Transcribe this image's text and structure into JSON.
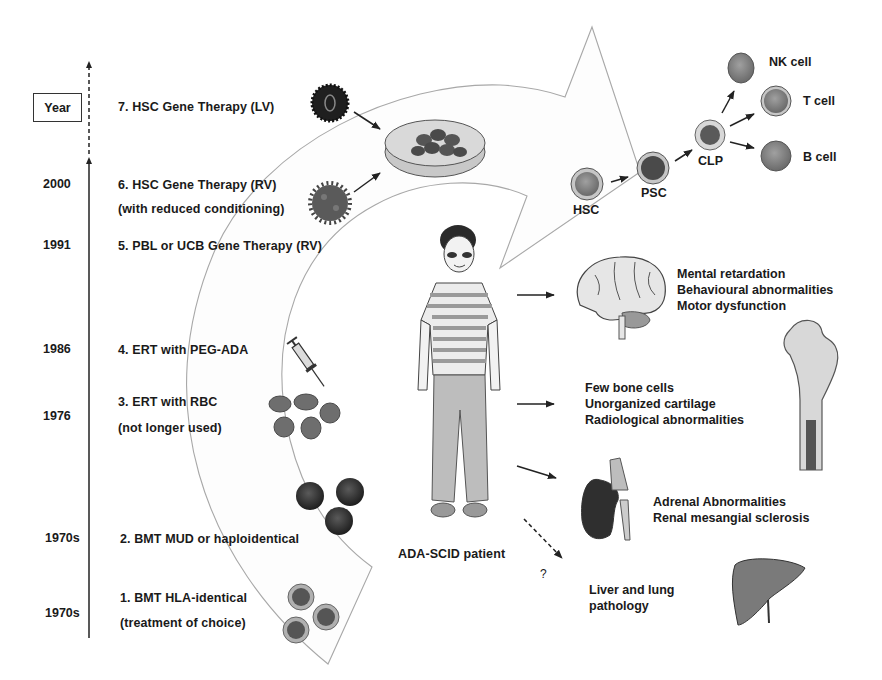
{
  "timeline": {
    "axis_label": "Year",
    "entries": [
      {
        "year": "",
        "label_lines": [
          "7. HSC Gene Therapy (LV)"
        ],
        "icon": "lentivirus-icon"
      },
      {
        "year": "2000",
        "label_lines": [
          "6. HSC Gene Therapy (RV)",
          "(with reduced conditioning)"
        ],
        "icon": "retrovirus-icon"
      },
      {
        "year": "1991",
        "label_lines": [
          "5. PBL or UCB Gene Therapy (RV)"
        ],
        "icon": ""
      },
      {
        "year": "1986",
        "label_lines": [
          "4. ERT with PEG-ADA"
        ],
        "icon": "syringe-icon"
      },
      {
        "year": "1976",
        "label_lines": [
          "3. ERT with RBC",
          "(not longer used)"
        ],
        "icon": "red-blood-cells-icon"
      },
      {
        "year": "1970s",
        "label_lines": [
          "2. BMT MUD or haploidentical"
        ],
        "icon": "bone-marrow-cells-icon"
      },
      {
        "year": "1970s",
        "label_lines": [
          "1. BMT HLA-identical",
          "(treatment of choice)"
        ],
        "icon": "hla-cells-icon"
      }
    ]
  },
  "patient": {
    "label": "ADA-SCID patient"
  },
  "hematopoiesis": {
    "cells": [
      {
        "id": "hsc",
        "label": "HSC"
      },
      {
        "id": "psc",
        "label": "PSC"
      },
      {
        "id": "clp",
        "label": "CLP"
      },
      {
        "id": "nk",
        "label": "NK cell"
      },
      {
        "id": "t",
        "label": "T cell"
      },
      {
        "id": "b",
        "label": "B cell"
      }
    ]
  },
  "manifestations": [
    {
      "organ": "brain",
      "lines": [
        "Mental retardation",
        "Behavioural abnormalities",
        "Motor dysfunction"
      ]
    },
    {
      "organ": "bone",
      "lines": [
        "Few bone cells",
        "Unorganized cartilage",
        "Radiological abnormalities"
      ]
    },
    {
      "organ": "kidney",
      "lines": [
        "Adrenal Abnormalities",
        "Renal mesangial sclerosis"
      ]
    },
    {
      "organ": "liver",
      "lines": [
        "Liver and lung",
        "pathology"
      ],
      "uncertain_marker": "?"
    }
  ],
  "colors": {
    "text": "#1a1a1a",
    "arrow_outline": "#a8a8a8",
    "cell_fill": "#8a8a8a",
    "cell_dark": "#3a3a3a",
    "organ_light": "#e6e6e6"
  }
}
